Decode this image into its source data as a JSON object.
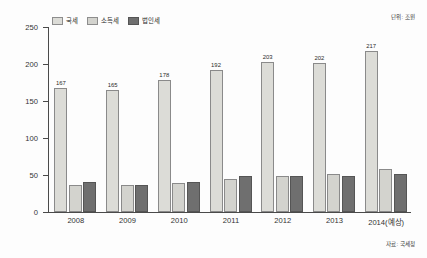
{
  "chart_data": {
    "type": "bar",
    "title": "",
    "subtitle": "",
    "unit_note": "단위: 조원",
    "source_note": "자료: 국세청",
    "categories": [
      "2008",
      "2009",
      "2010",
      "2011",
      "2012",
      "2013",
      "2014(예상)"
    ],
    "series": [
      {
        "name": "국세",
        "color": "#dcdcd7",
        "values": [
          167,
          165,
          178,
          192,
          203,
          202,
          217
        ],
        "show_labels": true
      },
      {
        "name": "소득세",
        "color": "#d3d3ce",
        "values": [
          37,
          36,
          39,
          45,
          49,
          52,
          58
        ],
        "show_labels": false
      },
      {
        "name": "법인세",
        "color": "#6f6f6f",
        "values": [
          40,
          37,
          40,
          48,
          49,
          48,
          51
        ],
        "show_labels": false
      }
    ],
    "xlabel": "",
    "ylabel": "",
    "ylim": [
      0,
      250
    ],
    "y_ticks": [
      0,
      50,
      100,
      150,
      200,
      250
    ],
    "grid": false,
    "legend_position": "top-left"
  }
}
